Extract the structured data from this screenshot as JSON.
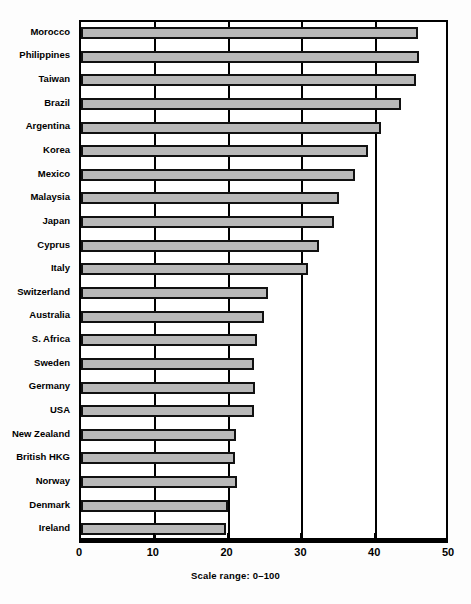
{
  "chart_data": {
    "type": "bar",
    "orientation": "horizontal",
    "title": "",
    "subtitle": "",
    "caption": "Scale range: 0–100",
    "xlabel": "",
    "ylabel": "",
    "xlim": [
      0,
      50
    ],
    "ylim": null,
    "grid": true,
    "grid_axis": "x",
    "legend": null,
    "legend_position": "none",
    "xticks": [
      0,
      10,
      20,
      30,
      40,
      50
    ],
    "xtick_labels": [
      "0",
      "10",
      "20",
      "30",
      "40",
      "50"
    ],
    "categories": [
      "Morocco",
      "Philippines",
      "Taiwan",
      "Brazil",
      "Argentina",
      "Korea",
      "Mexico",
      "Malaysia",
      "Japan",
      "Cyprus",
      "Italy",
      "Switzerland",
      "Australia",
      "S. Africa",
      "Sweden",
      "Germany",
      "USA",
      "New Zealand",
      "British HKG",
      "Norway",
      "Denmark",
      "Ireland"
    ],
    "values": [
      45.6,
      45.8,
      45.4,
      43.3,
      40.7,
      38.9,
      37.1,
      34.9,
      34.3,
      32.2,
      30.7,
      25.3,
      24.8,
      23.8,
      23.4,
      23.6,
      23.5,
      21.0,
      20.9,
      21.1,
      19.9,
      19.6
    ],
    "bar_color": "#b8b8b8",
    "bar_edge_color": "#111111",
    "axis_color": "#000000",
    "background_color": "#ffffff"
  }
}
